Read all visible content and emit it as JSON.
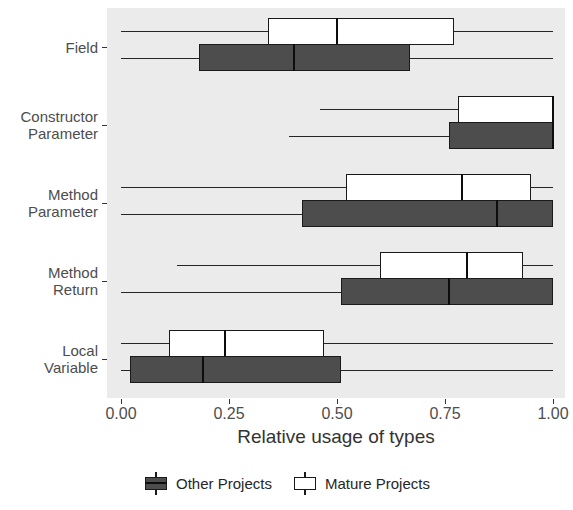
{
  "chart_data": {
    "type": "boxplot",
    "title": "",
    "xlabel": "Relative usage of types",
    "ylabel": "",
    "xlim": [
      0.0,
      1.0
    ],
    "xticks": [
      "0.00",
      "0.25",
      "0.50",
      "0.75",
      "1.00"
    ],
    "xtick_values": [
      0.0,
      0.25,
      0.5,
      0.75,
      1.0
    ],
    "grid": false,
    "legend_position": "bottom",
    "orientation": "horizontal",
    "categories": [
      "Field",
      "Constructor\nParameter",
      "Method\nParameter",
      "Method\nReturn",
      "Local\nVariable"
    ],
    "series": [
      {
        "name": "Mature Projects",
        "color": "#ffffff",
        "boxes": [
          {
            "category": "Field",
            "whisker_low": 0.0,
            "q1": 0.34,
            "median": 0.5,
            "q3": 0.77,
            "whisker_high": 1.0
          },
          {
            "category": "Constructor Parameter",
            "whisker_low": 0.46,
            "q1": 0.78,
            "median": 1.0,
            "q3": 1.0,
            "whisker_high": 1.0
          },
          {
            "category": "Method Parameter",
            "whisker_low": 0.0,
            "q1": 0.52,
            "median": 0.79,
            "q3": 0.95,
            "whisker_high": 1.0
          },
          {
            "category": "Method Return",
            "whisker_low": 0.13,
            "q1": 0.6,
            "median": 0.8,
            "q3": 0.93,
            "whisker_high": 1.0
          },
          {
            "category": "Local Variable",
            "whisker_low": 0.0,
            "q1": 0.11,
            "median": 0.24,
            "q3": 0.47,
            "whisker_high": 1.0
          }
        ]
      },
      {
        "name": "Other Projects",
        "color": "#4d4d4d",
        "boxes": [
          {
            "category": "Field",
            "whisker_low": 0.0,
            "q1": 0.18,
            "median": 0.4,
            "q3": 0.67,
            "whisker_high": 1.0
          },
          {
            "category": "Constructor Parameter",
            "whisker_low": 0.39,
            "q1": 0.76,
            "median": 1.0,
            "q3": 1.0,
            "whisker_high": 1.0
          },
          {
            "category": "Method Parameter",
            "whisker_low": 0.0,
            "q1": 0.42,
            "median": 0.87,
            "q3": 1.0,
            "whisker_high": 1.0
          },
          {
            "category": "Method Return",
            "whisker_low": 0.0,
            "q1": 0.51,
            "median": 0.76,
            "q3": 1.0,
            "whisker_high": 1.0
          },
          {
            "category": "Local Variable",
            "whisker_low": 0.0,
            "q1": 0.02,
            "median": 0.19,
            "q3": 0.51,
            "whisker_high": 1.0
          }
        ]
      }
    ]
  },
  "legend": {
    "items": [
      {
        "label": "Other Projects",
        "key": "other"
      },
      {
        "label": "Mature Projects",
        "key": "mature"
      }
    ]
  },
  "axis": {
    "x_title": "Relative usage of types"
  }
}
